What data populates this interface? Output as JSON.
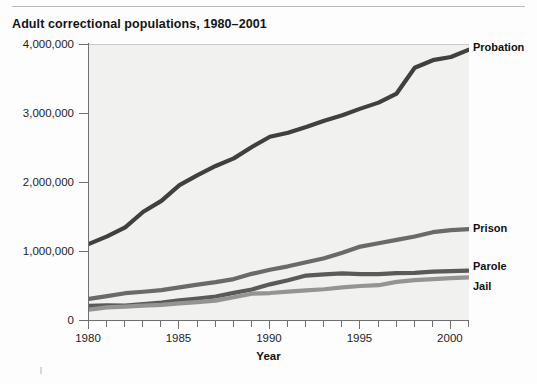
{
  "chart_data": {
    "type": "line",
    "title": "Adult correctional populations, 1980–2001",
    "xlabel": "Year",
    "ylabel": "",
    "xlim": [
      1980,
      2001
    ],
    "ylim": [
      0,
      4000000
    ],
    "grid": false,
    "legend_position": "right-of-plot-inline",
    "x": [
      1980,
      1981,
      1982,
      1983,
      1984,
      1985,
      1986,
      1987,
      1988,
      1989,
      1990,
      1991,
      1992,
      1993,
      1994,
      1995,
      1996,
      1997,
      1998,
      1999,
      2000,
      2001
    ],
    "xtick_labels": [
      "1980",
      "1985",
      "1990",
      "1995",
      "2000"
    ],
    "xtick_values": [
      1980,
      1985,
      1990,
      1995,
      2000
    ],
    "ytick_labels": [
      "0",
      "1,000,000",
      "2,000,000",
      "3,000,000",
      "4,000,000"
    ],
    "ytick_values": [
      0,
      1000000,
      2000000,
      3000000,
      4000000
    ],
    "series": [
      {
        "name": "Probation",
        "color": "#3f3f3f",
        "values": [
          1118097,
          1225934,
          1357264,
          1582947,
          1740948,
          1968712,
          2114621,
          2247158,
          2356483,
          2522125,
          2670234,
          2728472,
          2811611,
          2903061,
          2981022,
          3077861,
          3164996,
          3296513,
          3670441,
          3779922,
          3826209,
          3932751
        ]
      },
      {
        "name": "Prison",
        "color": "#6a6a6a",
        "values": [
          319598,
          360029,
          402914,
          423898,
          448264,
          487593,
          526436,
          562814,
          607766,
          683367,
          743382,
          792535,
          850566,
          909381,
          990147,
          1078542,
          1127528,
          1176564,
          1224469,
          1287172,
          1316333,
          1330980
        ]
      },
      {
        "name": "Parole",
        "color": "#5a5a5a",
        "values": [
          220438,
          225539,
          224604,
          246440,
          266992,
          300203,
          325638,
          355505,
          407977,
          456803,
          531407,
          590442,
          658601,
          676100,
          690371,
          679421,
          679733,
          694787,
          696385,
          714457,
          723898,
          731147
        ]
      },
      {
        "name": "Jail",
        "color": "#949494",
        "values": [
          163994,
          196785,
          209582,
          223551,
          234500,
          256615,
          274444,
          295873,
          343569,
          395553,
          405320,
          426479,
          444584,
          459804,
          486474,
          507044,
          518492,
          567079,
          592462,
          605943,
          621149,
          631240
        ]
      }
    ],
    "annotations": []
  },
  "figure": {
    "title": "Adult correctional populations, 1980–2001",
    "x_axis_title": "Year",
    "y_ticks": [
      {
        "label": "4,000,000",
        "value": 4000000
      },
      {
        "label": "3,000,000",
        "value": 3000000
      },
      {
        "label": "2,000,000",
        "value": 2000000
      },
      {
        "label": "1,000,000",
        "value": 1000000
      },
      {
        "label": "0",
        "value": 0
      }
    ],
    "x_ticks": [
      {
        "label": "1980",
        "value": 1980
      },
      {
        "label": "1985",
        "value": 1985
      },
      {
        "label": "1990",
        "value": 1990
      },
      {
        "label": "1995",
        "value": 1995
      },
      {
        "label": "2000",
        "value": 2000
      }
    ],
    "series_labels": [
      {
        "name": "Probation",
        "value": 3932751
      },
      {
        "name": "Prison",
        "value": 1330980
      },
      {
        "name": "Parole",
        "value": 731147
      },
      {
        "name": "Jail",
        "value": 631240
      }
    ],
    "colors": {
      "plot_background": "#f1f1ef",
      "page_background": "#fdfdfd",
      "axis": "#6f6f6f",
      "text": "#111111"
    }
  }
}
